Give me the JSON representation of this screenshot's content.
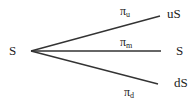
{
  "diagram": {
    "type": "trinomial-tree",
    "root": {
      "label": "S"
    },
    "branches": [
      {
        "id": "up",
        "prob_symbol": "π",
        "prob_sub": "u",
        "node_label": "uS"
      },
      {
        "id": "mid",
        "prob_symbol": "π",
        "prob_sub": "m",
        "node_label": "S"
      },
      {
        "id": "down",
        "prob_symbol": "π",
        "prob_sub": "d",
        "node_label": "dS"
      }
    ],
    "line_color": "#333333"
  }
}
